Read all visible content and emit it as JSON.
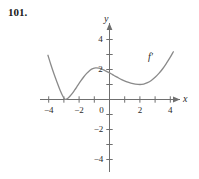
{
  "problem": {
    "number": "101."
  },
  "figure": {
    "curve_label": "f′",
    "axis_x_label": "x",
    "axis_y_label": "y"
  },
  "chart_data": {
    "type": "line",
    "title": "",
    "subtitle": "",
    "xlabel": "x",
    "ylabel": "y",
    "grid": false,
    "legend": [
      "f′"
    ],
    "legend_position": "inline-right",
    "annotations": [
      {
        "text": "f′",
        "x": 3.0,
        "y": 3.1
      }
    ],
    "xlim": [
      -4.6,
      4.9
    ],
    "ylim": [
      -5.2,
      5.0
    ],
    "xticks": [
      -4,
      -2,
      2,
      4
    ],
    "xticklabels": [
      "−4",
      "−2",
      "2",
      "4"
    ],
    "xticks_all": [
      -4,
      -3,
      -2,
      -1,
      1,
      2,
      3,
      4
    ],
    "yticks": [
      4,
      2,
      -2,
      -4
    ],
    "yticklabels": [
      "4",
      "2",
      "−2",
      "−4"
    ],
    "yticks_all": [
      4,
      3,
      2,
      1,
      -1,
      -2,
      -3,
      -4
    ],
    "origin_label": "0",
    "series": [
      {
        "name": "f′",
        "color": "#8a8a8a",
        "points": [
          [
            -4.05,
            2.95
          ],
          [
            -3.85,
            2.3
          ],
          [
            -3.65,
            1.7
          ],
          [
            -3.45,
            1.15
          ],
          [
            -3.25,
            0.62
          ],
          [
            -3.05,
            0.18
          ],
          [
            -2.95,
            0.04
          ],
          [
            -2.85,
            0.02
          ],
          [
            -2.7,
            0.12
          ],
          [
            -2.5,
            0.34
          ],
          [
            -2.3,
            0.62
          ],
          [
            -2.1,
            0.92
          ],
          [
            -1.9,
            1.22
          ],
          [
            -1.7,
            1.5
          ],
          [
            -1.5,
            1.74
          ],
          [
            -1.3,
            1.94
          ],
          [
            -1.1,
            2.06
          ],
          [
            -0.9,
            2.11
          ],
          [
            -0.7,
            2.09
          ],
          [
            -0.5,
            2.02
          ],
          [
            -0.3,
            1.93
          ],
          [
            -0.1,
            1.83
          ],
          [
            0.1,
            1.72
          ],
          [
            0.3,
            1.6
          ],
          [
            0.5,
            1.49
          ],
          [
            0.8,
            1.32
          ],
          [
            1.1,
            1.19
          ],
          [
            1.4,
            1.09
          ],
          [
            1.7,
            1.03
          ],
          [
            2.0,
            1.0
          ],
          [
            2.25,
            1.03
          ],
          [
            2.5,
            1.12
          ],
          [
            2.75,
            1.27
          ],
          [
            3.0,
            1.48
          ],
          [
            3.25,
            1.74
          ],
          [
            3.5,
            2.05
          ],
          [
            3.75,
            2.42
          ],
          [
            4.0,
            2.82
          ],
          [
            4.2,
            3.18
          ]
        ]
      }
    ]
  }
}
